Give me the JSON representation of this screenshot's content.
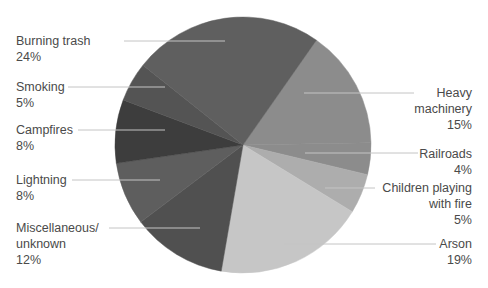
{
  "chart_data": {
    "type": "pie",
    "title": "",
    "categories": [
      "Heavy machinery",
      "Railroads",
      "Children playing with fire",
      "Arson",
      "Miscellaneous/unknown",
      "Lightning",
      "Campfires",
      "Smoking",
      "Burning trash"
    ],
    "values": [
      15,
      4,
      5,
      19,
      12,
      8,
      8,
      5,
      24
    ],
    "unit": "%",
    "start_angle_deg": 35,
    "direction": "clockwise",
    "colors": [
      "#8c8c8c",
      "#8c8c8c",
      "#adadad",
      "#c6c6c6",
      "#505050",
      "#5e5e5e",
      "#3d3d3d",
      "#545454",
      "#5f5f5f"
    ],
    "legend": "leader-line labels"
  },
  "labels": {
    "burning_trash": {
      "name": "Burning trash",
      "pct": "24%"
    },
    "smoking": {
      "name": "Smoking",
      "pct": "5%"
    },
    "campfires": {
      "name": "Campfires",
      "pct": "8%"
    },
    "lightning": {
      "name": "Lightning",
      "pct": "8%"
    },
    "misc": {
      "line1": "Miscellaneous/",
      "line2": "unknown",
      "pct": "12%"
    },
    "heavy": {
      "line1": "Heavy",
      "line2": "machinery",
      "pct": "15%"
    },
    "railroads": {
      "name": "Railroads",
      "pct": "4%"
    },
    "children": {
      "line1": "Children playing",
      "line2": "with fire",
      "pct": "5%"
    },
    "arson": {
      "name": "Arson",
      "pct": "19%"
    }
  }
}
